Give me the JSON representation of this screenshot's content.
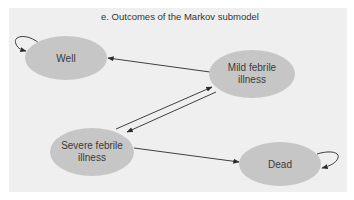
{
  "diagram": {
    "title": "e. Outcomes of the Markov submodel",
    "colors": {
      "panel_background": "#efefef",
      "node_fill": "#c6c6c6",
      "edge": "#2b2b2b",
      "text": "#333333"
    },
    "nodes": [
      {
        "id": "well",
        "label_line1": "Well",
        "label_line2": ""
      },
      {
        "id": "mild",
        "label_line1": "Mild febrile",
        "label_line2": "illness"
      },
      {
        "id": "severe",
        "label_line1": "Severe febrile",
        "label_line2": "illness"
      },
      {
        "id": "dead",
        "label_line1": "Dead",
        "label_line2": ""
      }
    ],
    "edges": [
      {
        "from": "well",
        "to": "well",
        "type": "self-loop"
      },
      {
        "from": "mild",
        "to": "well",
        "type": "transition"
      },
      {
        "from": "severe",
        "to": "mild",
        "type": "transition"
      },
      {
        "from": "mild",
        "to": "severe",
        "type": "transition"
      },
      {
        "from": "severe",
        "to": "dead",
        "type": "transition"
      },
      {
        "from": "dead",
        "to": "dead",
        "type": "self-loop"
      }
    ]
  }
}
